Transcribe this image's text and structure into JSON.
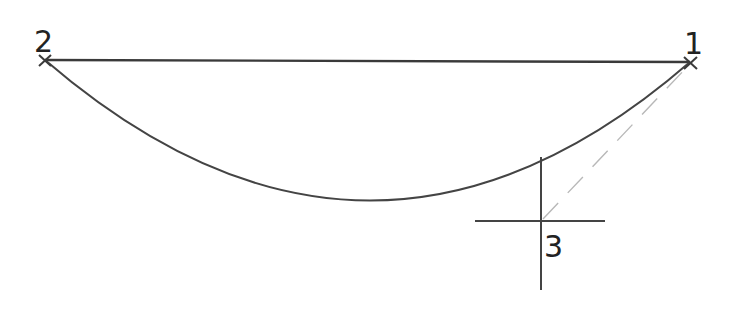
{
  "diagram": {
    "colors": {
      "stroke": "#3a3a3a",
      "dashed": "#b8b8b8",
      "background": "#ffffff"
    },
    "points": [
      {
        "id": "1",
        "label": "1",
        "x": 690,
        "y": 62
      },
      {
        "id": "2",
        "label": "2",
        "x": 45,
        "y": 60
      },
      {
        "id": "3",
        "label": "3",
        "x": 541,
        "y": 221
      }
    ],
    "labels": {
      "p1": "1",
      "p2": "2",
      "p3": "3"
    }
  }
}
